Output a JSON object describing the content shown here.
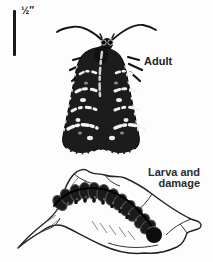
{
  "figure": {
    "scale_bar": {
      "label": "½″"
    },
    "adult": {
      "label": "Adult",
      "illustration": "moth-adult-dorsal-view"
    },
    "larva": {
      "label_line1": "Larva and",
      "label_line2": "damage",
      "illustration": "larva-on-damaged-leaf"
    },
    "colors": {
      "ink": "#1a1a1a",
      "background": "#fdfdfd"
    }
  }
}
